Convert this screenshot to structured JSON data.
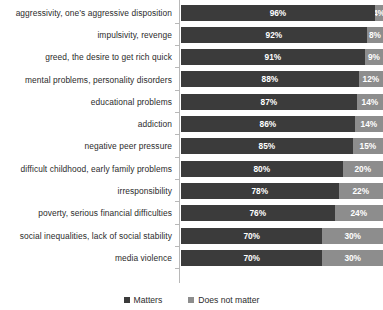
{
  "chart_data": {
    "type": "bar",
    "subtype": "stacked-horizontal-100",
    "title": "",
    "subtitle": "",
    "xlabel": "",
    "ylabel": "",
    "xlim": [
      0,
      100
    ],
    "grid": false,
    "legend_position": "bottom",
    "value_suffix": "%",
    "categories": [
      "aggressivity, one’s aggressive disposition",
      "impulsivity, revenge",
      "greed, the desire to get rich quick",
      "mental problems, personality disorders",
      "educational problems",
      "addiction",
      "negative peer pressure",
      "difficult childhood, early family problems",
      "irresponsibility",
      "poverty, serious financial difficulties",
      "social inequalities, lack of social stability",
      "media violence"
    ],
    "series": [
      {
        "name": "Matters",
        "color": "#3b3b3b",
        "values": [
          96,
          92,
          91,
          88,
          87,
          86,
          85,
          80,
          78,
          76,
          70,
          70
        ],
        "labels": [
          "96%",
          "92%",
          "91%",
          "88%",
          "87%",
          "86%",
          "85%",
          "80%",
          "78%",
          "76%",
          "70%",
          "70%"
        ]
      },
      {
        "name": "Does not matter",
        "color": "#8d8d8d",
        "values": [
          4,
          8,
          9,
          12,
          14,
          14,
          15,
          20,
          22,
          24,
          30,
          30
        ],
        "labels": [
          "4%",
          "8%",
          "9%",
          "12%",
          "14%",
          "14%",
          "15%",
          "20%",
          "22%",
          "24%",
          "30%",
          "30%"
        ]
      }
    ]
  },
  "legend": {
    "entries": [
      {
        "label": "Matters",
        "swatch": "matters-swatch-icon"
      },
      {
        "label": "Does not matter",
        "swatch": "does-not-matter-swatch-icon"
      }
    ]
  }
}
